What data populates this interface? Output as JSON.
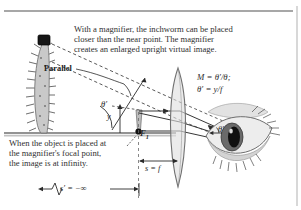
{
  "figure": {
    "colors": {
      "ink": "#2b2b2b",
      "rule": "#7a7a7a",
      "ground": "#8f8f8f",
      "worm_body": "#c9c9c9",
      "worm_head": "#1a1a1a",
      "lens_fill": "#dcdcdc",
      "eye_fill": "#d8d8d8",
      "iris": "#5a5a5a",
      "pupil": "#141414"
    }
  },
  "captions": {
    "top_lines": [
      "With a magnifier, the inchworm can be placed",
      "closer than the near point. The magnifier",
      "creates an enlarged upright virtual image."
    ],
    "bottom_lines": [
      "When the object is placed at",
      "the magnifier's focal point,",
      "the image is at infinity."
    ]
  },
  "equations": {
    "magnification": "M = θ′/θ;",
    "angle": "θ′ = y/f"
  },
  "labels": {
    "parallel": "Parallel",
    "theta_prime": "θ′",
    "theta_prime_eye": "θ′",
    "object_height": "y",
    "focal_point": "F",
    "focal_point_sub": "1",
    "object_distance": "s = f",
    "image_distance": "s′ = −∞"
  },
  "elements": {
    "lens": "converging-lens",
    "eye": "human-eye",
    "object": "inchworm-caterpillar",
    "optical_axis": "horizontal-ground-axis",
    "rays_solid": "refracted-rays",
    "rays_dashed": "parallel-virtual-image-rays"
  }
}
